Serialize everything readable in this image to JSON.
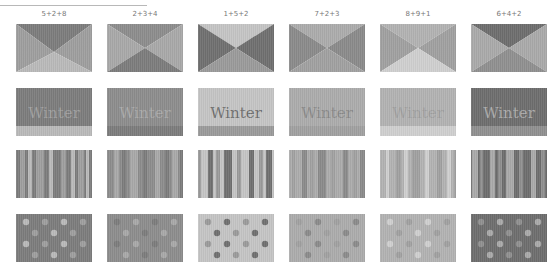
{
  "palette": {
    "1": "#c2c2c2",
    "2": "#8e8e8e",
    "3": "#a4a4a4",
    "4": "#7c7c7c",
    "5": "#7a7a7a",
    "6": "#6e6e6e",
    "7": "#a9a9a9",
    "8": "#b4b4b4",
    "9": "#a0a0a0"
  },
  "rows": [
    "envelope",
    "winter",
    "stripes",
    "dots"
  ],
  "winter_text": "Winter",
  "combos": [
    {
      "label": "5+2+8",
      "colors": [
        "#7c7c7c",
        "#9e9e9e",
        "#b9b9b9"
      ]
    },
    {
      "label": "2+3+4",
      "colors": [
        "#8c8c8c",
        "#a8a8a8",
        "#7c7c7c"
      ]
    },
    {
      "label": "1+5+2",
      "colors": [
        "#c4c4c4",
        "#6f6f6f",
        "#9a9a9a"
      ]
    },
    {
      "label": "7+2+3",
      "colors": [
        "#ababab",
        "#8a8a8a",
        "#a0a0a0"
      ]
    },
    {
      "label": "8+9+1",
      "colors": [
        "#b2b2b2",
        "#a0a0a0",
        "#cfcfcf"
      ]
    },
    {
      "label": "6+4+2",
      "colors": [
        "#6d6d6d",
        "#a9a9a9",
        "#8f8f8f"
      ]
    }
  ]
}
